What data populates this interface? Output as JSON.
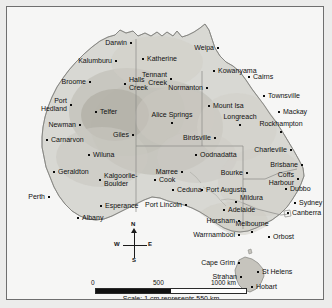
{
  "map": {
    "title": "Australia reference map",
    "scale": {
      "caption": "Scale: 1 cm represents 550 km",
      "ticks": [
        "0",
        "500",
        "1000 km"
      ],
      "unit": "km"
    },
    "compass": {
      "north": "N",
      "south": "S",
      "east": "E",
      "west": "W"
    },
    "colors": {
      "ocean": "#f6f6f5",
      "land": "#d9d9d4",
      "land_mid": "#c9c7c0",
      "land_dark": "#b7b4ac",
      "border": "#8c8c8c",
      "frame": "#6f6f6f",
      "text": "#101010"
    },
    "places": [
      {
        "name": "Darwin",
        "x": 124,
        "y": 36,
        "align": "right",
        "dx": -4,
        "dy": 0
      },
      {
        "name": "Katherine",
        "x": 136,
        "y": 52,
        "align": "left",
        "dx": 4,
        "dy": 0
      },
      {
        "name": "Weipa",
        "x": 211,
        "y": 41,
        "align": "right",
        "dx": -4,
        "dy": 0
      },
      {
        "name": "Kowanyama",
        "x": 207,
        "y": 64,
        "align": "left",
        "dx": 4,
        "dy": 0
      },
      {
        "name": "Cairns",
        "x": 242,
        "y": 70,
        "align": "left",
        "dx": 4,
        "dy": 0
      },
      {
        "name": "Kalumburu",
        "x": 109,
        "y": 54,
        "align": "right",
        "dx": -4,
        "dy": 0
      },
      {
        "name": "Normanton",
        "x": 200,
        "y": 81,
        "align": "right",
        "dx": -4,
        "dy": 0
      },
      {
        "name": "Townsville",
        "x": 257,
        "y": 89,
        "align": "left",
        "dx": 4,
        "dy": 0
      },
      {
        "name": "Broome",
        "x": 83,
        "y": 75,
        "align": "right",
        "dx": -4,
        "dy": 0
      },
      {
        "name": "Halls Creek",
        "x": 118,
        "y": 77,
        "align": "left",
        "dx": 4,
        "dy": -4
      },
      {
        "name": "Tennant Creek",
        "x": 164,
        "y": 72,
        "align": "right",
        "dx": -4,
        "dy": -4
      },
      {
        "name": "Mount Isa",
        "x": 202,
        "y": 99,
        "align": "left",
        "dx": 4,
        "dy": 0
      },
      {
        "name": "Mackay",
        "x": 272,
        "y": 105,
        "align": "left",
        "dx": 4,
        "dy": 0
      },
      {
        "name": "Port Hedland",
        "x": 64,
        "y": 98,
        "align": "right",
        "dx": -4,
        "dy": -4
      },
      {
        "name": "Telfer",
        "x": 89,
        "y": 105,
        "align": "left",
        "dx": 4,
        "dy": 0
      },
      {
        "name": "Alice Springs",
        "x": 165,
        "y": 116,
        "align": "center",
        "dx": 0,
        "dy": -8
      },
      {
        "name": "Longreach",
        "x": 233,
        "y": 118,
        "align": "center",
        "dx": 0,
        "dy": -8
      },
      {
        "name": "Rockhampton",
        "x": 274,
        "y": 125,
        "align": "center",
        "dx": 0,
        "dy": -8
      },
      {
        "name": "Newman",
        "x": 73,
        "y": 118,
        "align": "right",
        "dx": -4,
        "dy": 0
      },
      {
        "name": "Giles",
        "x": 126,
        "y": 128,
        "align": "right",
        "dx": -4,
        "dy": 0
      },
      {
        "name": "Birdsville",
        "x": 208,
        "y": 131,
        "align": "right",
        "dx": -4,
        "dy": 0
      },
      {
        "name": "Charleville",
        "x": 284,
        "y": 143,
        "align": "right",
        "dx": -4,
        "dy": 0
      },
      {
        "name": "Carnarvon",
        "x": 40,
        "y": 133,
        "align": "left",
        "dx": 4,
        "dy": 0
      },
      {
        "name": "Wiluna",
        "x": 82,
        "y": 148,
        "align": "left",
        "dx": 4,
        "dy": 0
      },
      {
        "name": "Oodnadatta",
        "x": 189,
        "y": 148,
        "align": "left",
        "dx": 4,
        "dy": 0
      },
      {
        "name": "Brisbane",
        "x": 295,
        "y": 158,
        "align": "right",
        "dx": -4,
        "dy": 0
      },
      {
        "name": "Geraldton",
        "x": 47,
        "y": 165,
        "align": "left",
        "dx": 4,
        "dy": 0
      },
      {
        "name": "Marree",
        "x": 175,
        "y": 165,
        "align": "right",
        "dx": -4,
        "dy": 0
      },
      {
        "name": "Bourke",
        "x": 240,
        "y": 166,
        "align": "right",
        "dx": -4,
        "dy": 0
      },
      {
        "name": "Coffs Harbour",
        "x": 291,
        "y": 172,
        "align": "right",
        "dx": -4,
        "dy": -4
      },
      {
        "name": "Kalgoorlie-Boulder",
        "x": 93,
        "y": 173,
        "align": "left",
        "dx": 4,
        "dy": -4
      },
      {
        "name": "Cook",
        "x": 148,
        "y": 173,
        "align": "left",
        "dx": 4,
        "dy": 0
      },
      {
        "name": "Ceduna",
        "x": 166,
        "y": 183,
        "align": "left",
        "dx": 4,
        "dy": 0
      },
      {
        "name": "Port Augusta",
        "x": 195,
        "y": 183,
        "align": "left",
        "dx": 4,
        "dy": 0
      },
      {
        "name": "Dubbo",
        "x": 279,
        "y": 182,
        "align": "left",
        "dx": 4,
        "dy": 0
      },
      {
        "name": "Perth",
        "x": 42,
        "y": 190,
        "align": "right",
        "dx": -4,
        "dy": 0
      },
      {
        "name": "Port Lincoln",
        "x": 179,
        "y": 198,
        "align": "right",
        "dx": -4,
        "dy": 0
      },
      {
        "name": "Mildura",
        "x": 229,
        "y": 195,
        "align": "left",
        "dx": 4,
        "dy": -4
      },
      {
        "name": "Sydney",
        "x": 288,
        "y": 196,
        "align": "left",
        "dx": 4,
        "dy": 0
      },
      {
        "name": "Esperance",
        "x": 94,
        "y": 199,
        "align": "left",
        "dx": 4,
        "dy": 0
      },
      {
        "name": "Adelaide",
        "x": 217,
        "y": 203,
        "align": "left",
        "dx": 4,
        "dy": 0
      },
      {
        "name": "Canberra",
        "x": 281,
        "y": 206,
        "align": "left",
        "dx": 4,
        "dy": 0
      },
      {
        "name": "Albany",
        "x": 71,
        "y": 211,
        "align": "left",
        "dx": 4,
        "dy": 0
      },
      {
        "name": "Horsham",
        "x": 232,
        "y": 214,
        "align": "right",
        "dx": -4,
        "dy": 0
      },
      {
        "name": "Melbourne",
        "x": 245,
        "y": 225,
        "align": "center",
        "dx": 0,
        "dy": -8
      },
      {
        "name": "Warrnambool",
        "x": 232,
        "y": 228,
        "align": "right",
        "dx": -4,
        "dy": 0
      },
      {
        "name": "Orbost",
        "x": 262,
        "y": 230,
        "align": "left",
        "dx": 4,
        "dy": 0
      },
      {
        "name": "Cape Grim",
        "x": 232,
        "y": 256,
        "align": "right",
        "dx": -4,
        "dy": 0
      },
      {
        "name": "St Helens",
        "x": 251,
        "y": 265,
        "align": "left",
        "dx": 4,
        "dy": 0
      },
      {
        "name": "Strahan",
        "x": 234,
        "y": 270,
        "align": "right",
        "dx": -4,
        "dy": 0
      },
      {
        "name": "Hobart",
        "x": 245,
        "y": 280,
        "align": "left",
        "dx": 4,
        "dy": 0
      }
    ]
  }
}
